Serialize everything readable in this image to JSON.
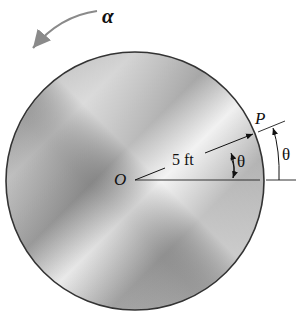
{
  "diagram": {
    "labels": {
      "alpha": "α",
      "origin": "O",
      "point": "P",
      "radius": "5 ft",
      "theta_inner": "θ",
      "theta_outer": "θ"
    },
    "colors": {
      "disk_light": "#e6e6e6",
      "disk_dark": "#8c8c8c",
      "outline": "#333333",
      "arrow": "#8a8a8a"
    }
  }
}
